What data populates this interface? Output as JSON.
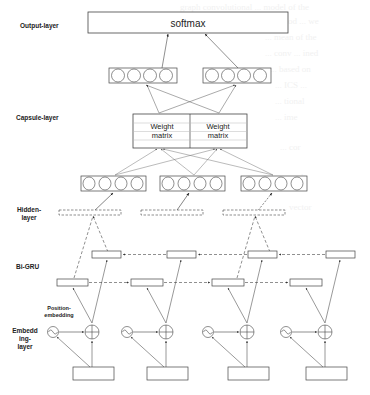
{
  "layers": {
    "output": "Output-layer",
    "capsule": "Capsule-layer",
    "hidden_line1": "Hidden-",
    "hidden_line2": "layer",
    "bigru": "Bi-GRU",
    "position_line1": "Position-",
    "position_line2": "embedding",
    "embedding_line1": "Embedd",
    "embedding_line2": "ing-",
    "embedding_line3": "layer"
  },
  "output_box": {
    "label": "softmax"
  },
  "weight_matrices": [
    {
      "line1": "Weight",
      "line2": "matrix"
    },
    {
      "line1": "Weight",
      "line2": "matrix"
    }
  ],
  "output_capsules": {
    "count": 2,
    "circles_each": 4
  },
  "primary_capsules": {
    "count": 3,
    "circles_each": 4
  },
  "hidden_units": {
    "count": 3,
    "style": "dashed"
  },
  "bigru": {
    "forward_count": 4,
    "backward_count": 4
  },
  "timesteps": 4,
  "colors": {
    "stroke": "#444444",
    "text": "#222222",
    "background": "#ffffff"
  }
}
